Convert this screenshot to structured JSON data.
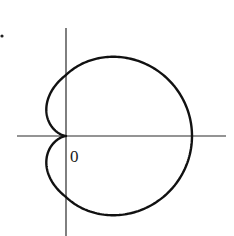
{
  "figure": {
    "type": "polar-curve",
    "curve_name": "cardioid",
    "equation": "r = a(1 + cos θ)",
    "origin_label": "0",
    "colors": {
      "curve": "#111111",
      "axis": "#2a2a2a",
      "background": "#ffffff"
    }
  },
  "geometry": {
    "origin": [
      66,
      136
    ],
    "x_axis": {
      "x1": 17,
      "x2": 226,
      "y": 136
    },
    "y_axis": {
      "x": 66,
      "y1": 28,
      "y2": 236
    },
    "scale_x": 63,
    "scale_y": 61,
    "a": 1,
    "label_pos": [
      70,
      162
    ],
    "dot": [
      2,
      36
    ]
  }
}
